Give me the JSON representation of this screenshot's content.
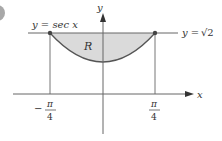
{
  "diagram": {
    "curve_label": "y = sec x",
    "line_label_prefix": "y = ",
    "line_label_value": "√2",
    "region_label": "R",
    "x_axis_label": "x",
    "y_axis_label": "y",
    "left_tick_sign": "−",
    "left_tick_num": "π",
    "left_tick_den": "4",
    "right_tick_num": "π",
    "right_tick_den": "4",
    "colors": {
      "region_fill": "#d9d9d9",
      "lines": "#555555",
      "badge": "#9a9a9a"
    }
  }
}
